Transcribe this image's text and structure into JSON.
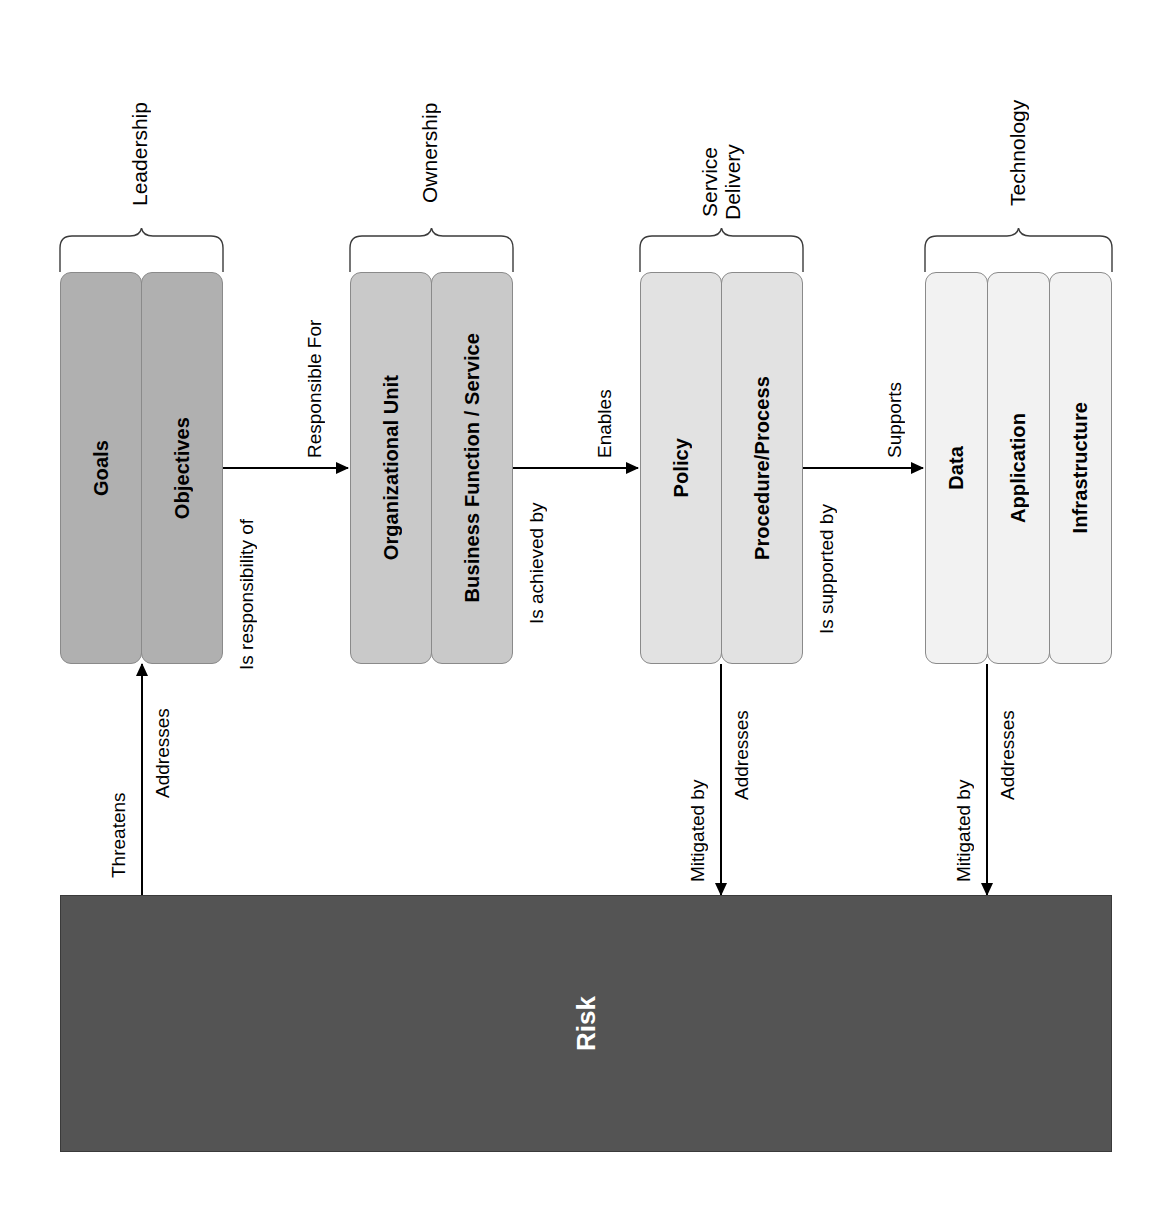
{
  "diagram": {
    "orientation": "rotated-90-ccw",
    "risk": {
      "label": "Risk",
      "fill_color": "#545454",
      "text_color": "#ffffff"
    },
    "groups": [
      {
        "caption": "Leadership",
        "fill_color": "#b0b0b0",
        "cells": [
          {
            "label": "Goals"
          },
          {
            "label": "Objectives"
          }
        ]
      },
      {
        "caption": "Ownership",
        "fill_color": "#c9c9c9",
        "cells": [
          {
            "label": "Organizational Unit"
          },
          {
            "label": "Business Function / Service"
          }
        ]
      },
      {
        "caption": "Service\nDelivery",
        "fill_color": "#e2e2e2",
        "cells": [
          {
            "label": "Policy"
          },
          {
            "label": "Procedure/Process"
          }
        ]
      },
      {
        "caption": "Technology",
        "fill_color": "#f2f2f2",
        "cells": [
          {
            "label": "Data"
          },
          {
            "label": "Application"
          },
          {
            "label": "Infrastructure"
          }
        ]
      }
    ],
    "connectors": [
      {
        "above": "Responsible For",
        "below": "Is responsibility of"
      },
      {
        "above": "Enables",
        "below": "Is achieved by"
      },
      {
        "above": "Supports",
        "below": "Is supported by"
      }
    ],
    "risk_edges": [
      {
        "left": "Threatens",
        "right": "Addresses",
        "direction": "up"
      },
      {
        "left": "Mitigated by",
        "right": "Addresses",
        "direction": "down"
      },
      {
        "left": "Mitigated by",
        "right": "Addresses",
        "direction": "down"
      }
    ]
  }
}
